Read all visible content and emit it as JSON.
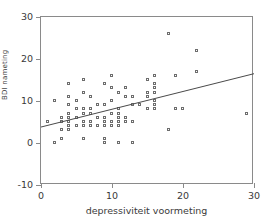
{
  "chart_data": {
    "type": "scatter",
    "title": "",
    "xlabel": "depressiviteit voormeting",
    "ylabel": "BDI nameting",
    "xlim": [
      0,
      30
    ],
    "ylim": [
      -10,
      30
    ],
    "xticks": [
      "0",
      "10",
      "20",
      "30"
    ],
    "xtick_values": [
      0,
      10,
      20,
      30
    ],
    "yticks": [
      "30",
      "20",
      "10",
      "0",
      "-10"
    ],
    "ytick_values": [
      30,
      20,
      10,
      0,
      -10
    ],
    "grid": false,
    "legend": "none",
    "marker": "open-square",
    "marker_color": "#6d6d6d",
    "frame_color": "#8a8a8a",
    "line_color": "#4a4a4a",
    "regression_line": {
      "x": [
        0,
        30
      ],
      "y": [
        3.8,
        16.5
      ],
      "intercept": 3.8,
      "slope": 0.423
    },
    "points": [
      {
        "x": 1,
        "y": 5
      },
      {
        "x": 2,
        "y": 0
      },
      {
        "x": 2,
        "y": 10
      },
      {
        "x": 3,
        "y": 1
      },
      {
        "x": 3,
        "y": 3
      },
      {
        "x": 3,
        "y": 5
      },
      {
        "x": 3,
        "y": 6
      },
      {
        "x": 4,
        "y": 3
      },
      {
        "x": 4,
        "y": 4
      },
      {
        "x": 4,
        "y": 5
      },
      {
        "x": 4,
        "y": 6
      },
      {
        "x": 4,
        "y": 7
      },
      {
        "x": 4,
        "y": 9
      },
      {
        "x": 4,
        "y": 11
      },
      {
        "x": 4,
        "y": 14
      },
      {
        "x": 5,
        "y": 4
      },
      {
        "x": 5,
        "y": 6
      },
      {
        "x": 5,
        "y": 8
      },
      {
        "x": 5,
        "y": 10
      },
      {
        "x": 6,
        "y": 1
      },
      {
        "x": 6,
        "y": 4
      },
      {
        "x": 6,
        "y": 5
      },
      {
        "x": 6,
        "y": 7
      },
      {
        "x": 6,
        "y": 8
      },
      {
        "x": 6,
        "y": 12
      },
      {
        "x": 6,
        "y": 15
      },
      {
        "x": 7,
        "y": 4
      },
      {
        "x": 7,
        "y": 5
      },
      {
        "x": 7,
        "y": 7
      },
      {
        "x": 7,
        "y": 8
      },
      {
        "x": 7,
        "y": 11
      },
      {
        "x": 8,
        "y": 4
      },
      {
        "x": 8,
        "y": 6
      },
      {
        "x": 8,
        "y": 9
      },
      {
        "x": 9,
        "y": 0
      },
      {
        "x": 9,
        "y": 1
      },
      {
        "x": 9,
        "y": 4
      },
      {
        "x": 9,
        "y": 5
      },
      {
        "x": 9,
        "y": 6
      },
      {
        "x": 9,
        "y": 9
      },
      {
        "x": 9,
        "y": 14
      },
      {
        "x": 10,
        "y": 4
      },
      {
        "x": 10,
        "y": 5
      },
      {
        "x": 10,
        "y": 7
      },
      {
        "x": 10,
        "y": 10
      },
      {
        "x": 10,
        "y": 13
      },
      {
        "x": 10,
        "y": 16
      },
      {
        "x": 11,
        "y": 0
      },
      {
        "x": 11,
        "y": 4
      },
      {
        "x": 11,
        "y": 5
      },
      {
        "x": 11,
        "y": 6
      },
      {
        "x": 11,
        "y": 7
      },
      {
        "x": 11,
        "y": 8
      },
      {
        "x": 11,
        "y": 12
      },
      {
        "x": 12,
        "y": 5
      },
      {
        "x": 12,
        "y": 6
      },
      {
        "x": 12,
        "y": 11
      },
      {
        "x": 12,
        "y": 13
      },
      {
        "x": 13,
        "y": 0
      },
      {
        "x": 13,
        "y": 5
      },
      {
        "x": 13,
        "y": 9
      },
      {
        "x": 13,
        "y": 11
      },
      {
        "x": 14,
        "y": 9
      },
      {
        "x": 15,
        "y": 8
      },
      {
        "x": 15,
        "y": 11
      },
      {
        "x": 15,
        "y": 12
      },
      {
        "x": 15,
        "y": 15
      },
      {
        "x": 16,
        "y": 8
      },
      {
        "x": 16,
        "y": 9
      },
      {
        "x": 16,
        "y": 10
      },
      {
        "x": 16,
        "y": 12
      },
      {
        "x": 16,
        "y": 13
      },
      {
        "x": 16,
        "y": 14
      },
      {
        "x": 16,
        "y": 16
      },
      {
        "x": 18,
        "y": 3
      },
      {
        "x": 18,
        "y": 26
      },
      {
        "x": 19,
        "y": 8
      },
      {
        "x": 19,
        "y": 16
      },
      {
        "x": 20,
        "y": 8
      },
      {
        "x": 22,
        "y": 17
      },
      {
        "x": 22,
        "y": 22
      },
      {
        "x": 29,
        "y": 7
      }
    ]
  }
}
